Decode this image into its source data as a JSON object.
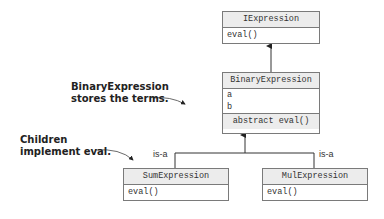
{
  "diagram": {
    "classes": {
      "iexpression": {
        "name": "IExpression",
        "members": [
          "eval()"
        ]
      },
      "binary": {
        "name": "BinaryExpression",
        "fields": [
          "a",
          "b"
        ],
        "method": "abstract eval()"
      },
      "sum": {
        "name": "SumExpression",
        "members": [
          "eval()"
        ]
      },
      "mul": {
        "name": "MulExpression",
        "members": [
          "eval()"
        ]
      }
    },
    "annotations": {
      "binary_note_line1": "BinaryExpression",
      "binary_note_line2": "stores the terms.",
      "children_note_line1": "Children",
      "children_note_line2": "implement eval."
    },
    "relations": {
      "sum_label": "is-a",
      "mul_label": "is-a"
    },
    "colors": {
      "border": "#7a7a7a",
      "header_fill": "#ececec",
      "line": "#333333"
    }
  }
}
